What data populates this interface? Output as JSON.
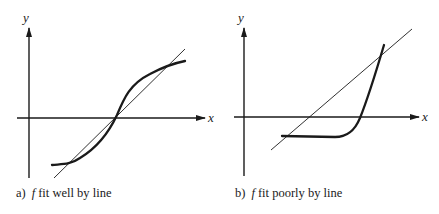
{
  "panels": [
    {
      "id": "a",
      "caption_prefix": "a)",
      "caption_var": "f",
      "caption_text": "fit well by line",
      "x_axis_label": "x",
      "y_axis_label": "y",
      "description": "S-shaped curve f closely approximated by a straight line through the origin"
    },
    {
      "id": "b",
      "caption_prefix": "b)",
      "caption_var": "f",
      "caption_text": "fit poorly by line",
      "x_axis_label": "x",
      "y_axis_label": "y",
      "description": "Hockey-stick curve f (flat then steeply rising) poorly approximated by a straight line"
    }
  ],
  "colors": {
    "ink": "#1a1a1a",
    "background": "#ffffff"
  }
}
